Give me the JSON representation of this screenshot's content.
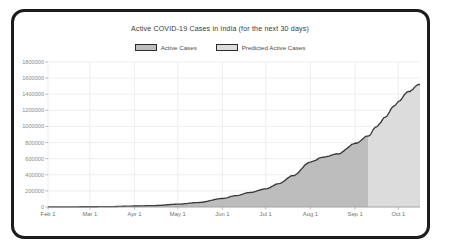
{
  "chart_data": {
    "type": "area",
    "title": "Active COVID-19 Cases in India (for the next 30 days)",
    "xlabel": "",
    "ylabel": "",
    "grid": true,
    "legend_position": "top-center",
    "ylim": [
      0,
      1800000
    ],
    "ytick_labels": [
      "1800000",
      "1600000",
      "1400000",
      "1200000",
      "1000000",
      "800000",
      "600000",
      "400000",
      "200000",
      "0"
    ],
    "ytick_values": [
      1800000,
      1600000,
      1400000,
      1200000,
      1000000,
      800000,
      600000,
      400000,
      200000,
      0
    ],
    "xtick_labels": [
      "Feb 1",
      "Mar 1",
      "Apr 1",
      "May 1",
      "Jun 1",
      "Jul 1",
      "Aug 1",
      "Sep 1",
      "Oct 1"
    ],
    "xlim": [
      "Feb 1",
      "Oct 16"
    ],
    "forecast_start_label": "Sep 10",
    "colors": {
      "line": "#3a3a3a",
      "actual_fill": "#bdbdbd",
      "predicted_fill": "#dcdcdc",
      "grid": "#e8e8e8",
      "axis": "#9a9a9a",
      "frame": "#1c1c1c"
    },
    "series": [
      {
        "name": "Active Cases",
        "x": [
          "Feb 1",
          "Feb 15",
          "Mar 1",
          "Mar 15",
          "Apr 1",
          "Apr 15",
          "May 1",
          "May 15",
          "Jun 1",
          "Jun 10",
          "Jun 20",
          "Jul 1",
          "Jul 10",
          "Jul 20",
          "Aug 1",
          "Aug 10",
          "Aug 20",
          "Sep 1",
          "Sep 10"
        ],
        "values": [
          1000,
          2000,
          3000,
          5000,
          12000,
          18000,
          35000,
          55000,
          105000,
          140000,
          180000,
          225000,
          290000,
          390000,
          560000,
          620000,
          660000,
          790000,
          880000
        ]
      },
      {
        "name": "Predicted Active Cases",
        "x": [
          "Sep 10",
          "Sep 16",
          "Sep 22",
          "Sep 28",
          "Oct 1",
          "Oct 8",
          "Oct 16"
        ],
        "values": [
          880000,
          1000000,
          1120000,
          1250000,
          1310000,
          1430000,
          1520000
        ]
      }
    ],
    "legend": [
      {
        "label": "Active Cases",
        "swatch": "#bdbdbd"
      },
      {
        "label": "Predicted Active Cases",
        "swatch": "#dcdcdc"
      }
    ]
  }
}
